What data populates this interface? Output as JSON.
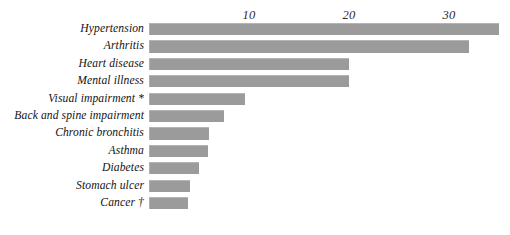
{
  "chart_data": {
    "type": "bar",
    "orientation": "horizontal",
    "title": "",
    "subtitle": "",
    "xlabel": "",
    "ylabel": "",
    "categories": [
      "Hypertension",
      "Arthritis",
      "Heart disease",
      "Mental illness",
      "Visual impairment *",
      "Back and spine impairment",
      "Chronic bronchitis",
      "Asthma",
      "Diabetes",
      "Stomach ulcer",
      "Cancer †"
    ],
    "values": [
      35,
      32,
      20,
      20,
      9.6,
      7.5,
      6,
      5.9,
      5,
      4.1,
      3.9
    ],
    "xlim": [
      0,
      35
    ],
    "xticks": [
      10,
      20,
      30
    ],
    "xtick_labels": [
      "10",
      "20",
      "30"
    ],
    "grid": false,
    "legend": null,
    "annotations": [
      "*",
      "†"
    ],
    "series": [
      {
        "name": "",
        "color": "#9b9b9b",
        "values": [
          35,
          32,
          20,
          20,
          9.6,
          7.5,
          6,
          5.9,
          5,
          4.1,
          3.9
        ]
      }
    ]
  },
  "colors": {
    "bar": "#9b9b9b",
    "bar_highlight": "#b4b4b4",
    "text": "#141414",
    "tick_text": "#2b2b2b",
    "background": "#ffffff"
  }
}
